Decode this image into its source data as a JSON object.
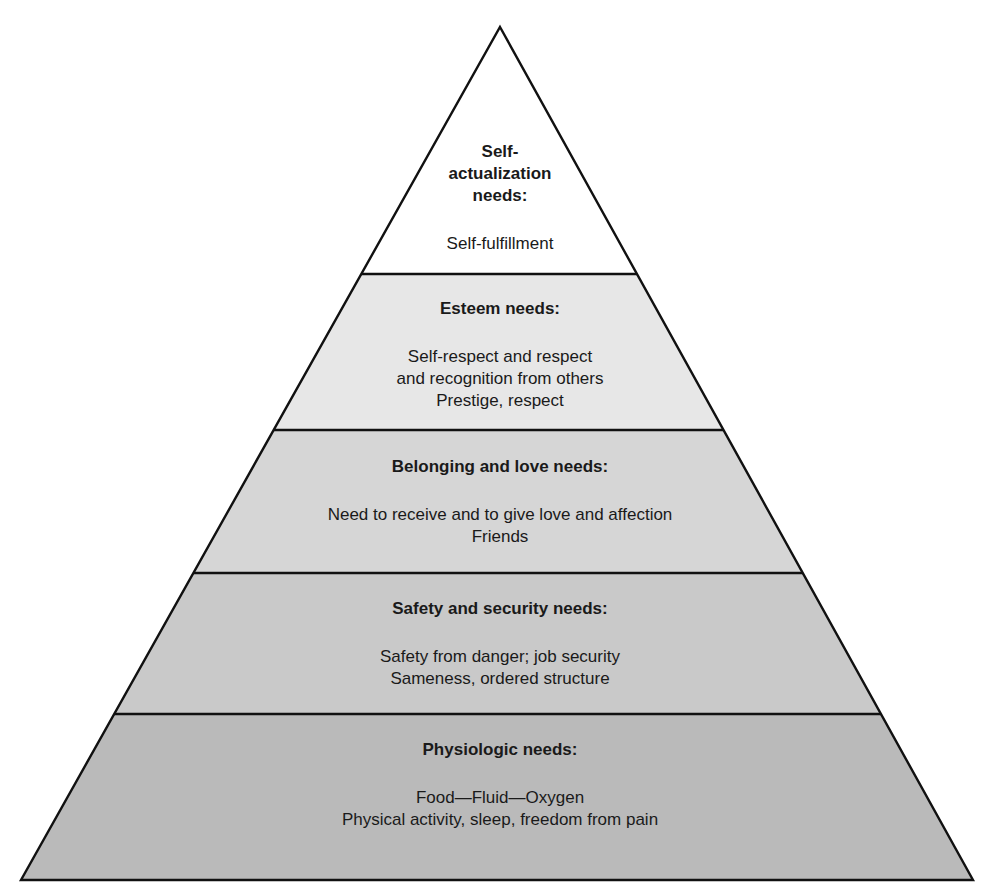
{
  "diagram": {
    "type": "pyramid",
    "order": "top-to-bottom",
    "tiers": [
      {
        "id": "self-actualization",
        "title_lines": [
          "Self-",
          "actualization",
          "needs:"
        ],
        "description_lines": [
          "Self-fulfillment"
        ],
        "fill": "#ffffff"
      },
      {
        "id": "esteem",
        "title_lines": [
          "Esteem needs:"
        ],
        "description_lines": [
          "Self-respect and respect",
          "and recognition from others",
          "Prestige, respect"
        ],
        "fill": "#e7e7e7"
      },
      {
        "id": "belonging-love",
        "title_lines": [
          "Belonging and love needs:"
        ],
        "description_lines": [
          "Need to receive and to give love and affection",
          "Friends"
        ],
        "fill": "#d6d6d6"
      },
      {
        "id": "safety-security",
        "title_lines": [
          "Safety and security needs:"
        ],
        "description_lines": [
          "Safety from danger; job security",
          "Sameness, ordered structure"
        ],
        "fill": "#c9c9c9"
      },
      {
        "id": "physiologic",
        "title_lines": [
          "Physiologic needs:"
        ],
        "description_lines": [
          "Food—Fluid—Oxygen",
          "Physical activity, sleep, freedom from pain"
        ],
        "fill": "#bababa"
      }
    ]
  }
}
